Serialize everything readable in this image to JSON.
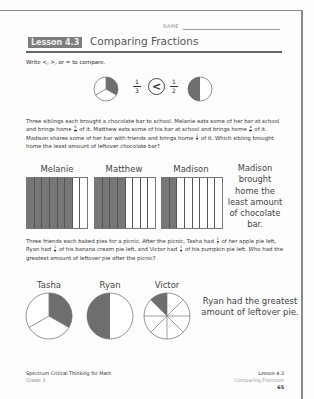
{
  "header": {
    "name_label": "NAME",
    "lesson_badge": "Lesson 4.3",
    "lesson_title": "Comparing Fractions"
  },
  "problem1": {
    "instruction": "Write <, >, or = to compare.",
    "left_fraction": {
      "num": "1",
      "den": "3"
    },
    "symbol": "<",
    "right_fraction": {
      "num": "1",
      "den": "2"
    }
  },
  "problem2": {
    "text_parts": [
      "Three siblings each brought a chocolate bar to school. Melanie eats some of her bar at school and brings home ",
      " of it. Matthew eats some of his bar at school and brings home ",
      " of it. Madison shares some of her bar with friends and brings home ",
      " of it. Which sibling brought home the least amount of leftover chocolate bar?"
    ],
    "fractions": [
      {
        "num": "6",
        "den": "8"
      },
      {
        "num": "4",
        "den": "8"
      },
      {
        "num": "2",
        "den": "8"
      }
    ],
    "bars": [
      {
        "name": "Melanie",
        "shaded": 6,
        "total": 8
      },
      {
        "name": "Matthew",
        "shaded": 4,
        "total": 8
      },
      {
        "name": "Madison",
        "shaded": 2,
        "total": 8
      }
    ],
    "answer": "Madison brought home the least amount of chocolate bar."
  },
  "problem3": {
    "text_parts": [
      "Three friends each baked pies for a picnic. After the picnic, Tasha had ",
      " of her apple pie left, Ryan had ",
      " of his banana cream pie left, and Victor had ",
      " of his pumpkin pie left. Who had the greatest amount of leftover pie after the picnic?"
    ],
    "fractions": [
      {
        "num": "1",
        "den": "3"
      },
      {
        "num": "1",
        "den": "2"
      },
      {
        "num": "1",
        "den": "8"
      }
    ],
    "pies": [
      {
        "name": "Tasha",
        "shaded": 1,
        "total": 3
      },
      {
        "name": "Ryan",
        "shaded": 1,
        "total": 2
      },
      {
        "name": "Victor",
        "shaded": 1,
        "total": 8
      }
    ],
    "answer": "Ryan had the greatest amount of leftover pie."
  },
  "footer": {
    "book_title": "Spectrum Critical Thinking for Math",
    "grade": "Grade 3",
    "lesson": "Lesson 4.3",
    "topic": "Comparing Fractions",
    "page_number": "65"
  },
  "colors": {
    "shade": "#6e6e6e",
    "badge_bg": "#7d7d7d"
  }
}
